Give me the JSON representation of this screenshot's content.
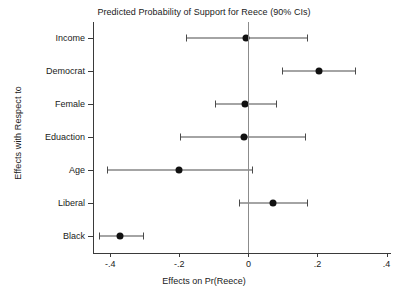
{
  "chart_data": {
    "type": "scatter",
    "title": "Predicted Probability of Support for Reece (90% CIs)",
    "xlabel": "Effects on Pr(Reece)",
    "ylabel": "Effects with Respect to",
    "xlim": [
      -0.45,
      0.41
    ],
    "xticks": [
      -0.4,
      -0.2,
      0,
      0.2,
      0.4
    ],
    "xticklabels": [
      "-.4",
      "-.2",
      "0",
      ".2",
      ".4"
    ],
    "grid": false,
    "legend": null,
    "reference_line": 0,
    "ci_level": "90%",
    "categories": [
      "Income",
      "Democrat",
      "Female",
      "Eduaction",
      "Age",
      "Liberal",
      "Black"
    ],
    "points": [
      {
        "label": "Income",
        "estimate": -0.006,
        "ci_low": -0.182,
        "ci_high": 0.171
      },
      {
        "label": "Democrat",
        "estimate": 0.203,
        "ci_low": 0.098,
        "ci_high": 0.31
      },
      {
        "label": "Female",
        "estimate": -0.009,
        "ci_low": -0.096,
        "ci_high": 0.081
      },
      {
        "label": "Eduaction",
        "estimate": -0.012,
        "ci_low": -0.197,
        "ci_high": 0.165
      },
      {
        "label": "Age",
        "estimate": -0.2,
        "ci_low": -0.409,
        "ci_high": 0.009
      },
      {
        "label": "Liberal",
        "estimate": 0.072,
        "ci_low": -0.026,
        "ci_high": 0.171
      },
      {
        "label": "Black",
        "estimate": -0.371,
        "ci_low": -0.432,
        "ci_high": -0.304
      }
    ]
  },
  "colors": {
    "marker": "#111111",
    "ci": "#4a4a4a",
    "axis": "#3a3a3a",
    "zero_line": "#8c8c8c",
    "background": "#ffffff",
    "text": "#1a1a1a"
  }
}
